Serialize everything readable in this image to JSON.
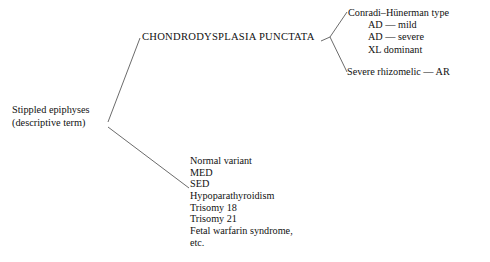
{
  "diagram": {
    "title_node": {
      "label": "CHONDRODYSPLASIA PUNCTATA"
    },
    "root_node": {
      "line1": "Stippled epiphyses",
      "line2": "(descriptive term)"
    },
    "branch_conradi": {
      "heading": "Conradi–Hünerman type",
      "subtypes": [
        "AD — mild",
        "AD — severe",
        "XL dominant"
      ]
    },
    "branch_rhizomelic": {
      "label": "Severe rhizomelic — AR"
    },
    "branch_other_causes": {
      "items": [
        "Normal variant",
        "MED",
        "SED",
        "Hypoparathyroidism",
        "Trisomy 18",
        "Trisomy 21",
        "Fetal warfarin syndrome,",
        "etc."
      ]
    },
    "style": {
      "line_color": "#5a5a5a",
      "text_color": "#111111",
      "background_color": "#ffffff"
    }
  }
}
